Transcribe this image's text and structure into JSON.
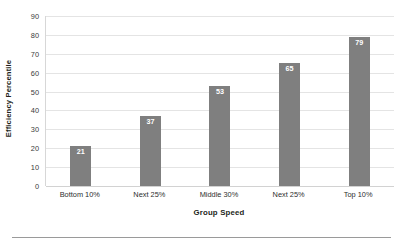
{
  "chart_data": {
    "type": "bar",
    "title": "",
    "subtitle": "",
    "categories": [
      "Bottom 10%",
      "Next 25%",
      "Middle 30%",
      "Next 25%",
      "Top 10%"
    ],
    "values": [
      21,
      37,
      53,
      65,
      79
    ],
    "data_labels": [
      "21",
      "37",
      "53",
      "65",
      "79"
    ],
    "xlabel": "Group Speed",
    "ylabel": "Efficiency Percentile",
    "ylim": [
      0,
      90
    ],
    "ytick_labels": [
      "90",
      "80",
      "70",
      "60",
      "50",
      "40",
      "30",
      "20",
      "10",
      "0"
    ],
    "ytick_values": [
      90,
      80,
      70,
      60,
      50,
      40,
      30,
      20,
      10,
      0
    ],
    "grid": "horizontal",
    "legend": "none",
    "bar_color": "#7f7f7f",
    "gridline_color": "#e4e4e4",
    "data_label_color": "#ffffff",
    "background_color": "#ffffff"
  }
}
